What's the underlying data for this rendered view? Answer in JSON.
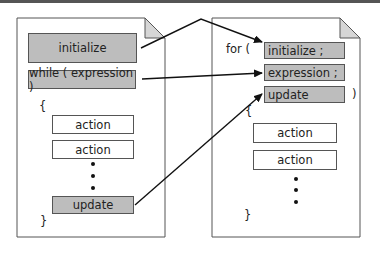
{
  "diagram": {
    "colors": {
      "shaded_box": "#bdbdbd",
      "border": "#555555",
      "page_fold": "#d6d6d6",
      "arrow": "#111111",
      "top_bar": "#555555"
    },
    "left_page": {
      "initialize": "initialize",
      "while_condition": "while ( expression )",
      "open_brace": "{",
      "actions": [
        "action",
        "action"
      ],
      "ellipsis": "•",
      "update": "update",
      "close_brace": "}"
    },
    "right_page": {
      "for_keyword": "for (",
      "initialize": "initialize ;",
      "expression": "expression ;",
      "update": "update",
      "close_paren": ")",
      "open_brace": "{",
      "actions": [
        "action",
        "action"
      ],
      "ellipsis": "•",
      "close_brace": "}"
    },
    "arrows": [
      {
        "from": "left_page.initialize",
        "to": "right_page.initialize"
      },
      {
        "from": "left_page.while_condition",
        "to": "right_page.expression"
      },
      {
        "from": "left_page.update",
        "to": "right_page.update"
      }
    ]
  }
}
